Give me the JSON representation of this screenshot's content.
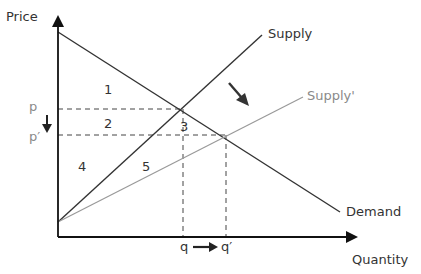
{
  "diagram": {
    "type": "supply-demand",
    "axes": {
      "y_label": "Price",
      "x_label": "Quantity"
    },
    "curves": [
      {
        "name": "Demand",
        "color": "#333333"
      },
      {
        "name": "Supply",
        "color": "#333333"
      },
      {
        "name": "Supply'",
        "color": "#999999"
      }
    ],
    "price_labels": {
      "p": "p",
      "p_prime": "p′"
    },
    "quantity_labels": {
      "q": "q",
      "q_prime": "q′"
    },
    "regions": [
      "1",
      "2",
      "3",
      "4",
      "5"
    ],
    "arrows": [
      "price-decrease",
      "quantity-increase",
      "supply-shift-right"
    ]
  }
}
